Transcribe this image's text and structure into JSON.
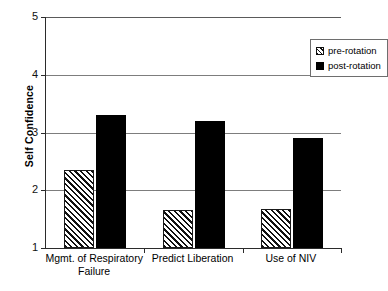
{
  "chart_data": {
    "type": "bar",
    "title": "",
    "xlabel": "",
    "ylabel": "Self Confidence",
    "ylim": [
      1,
      5
    ],
    "yticks": [
      1,
      2,
      3,
      4,
      5
    ],
    "ytick_labels": [
      "1",
      "2",
      "3",
      "4",
      "5"
    ],
    "grid": "horizontal",
    "legend_position": "top-right-inside",
    "categories": [
      "Mgmt. of Respiratory Failure",
      "Predict Liberation",
      "Use of NIV"
    ],
    "category_lines": [
      [
        "Mgmt. of Respiratory",
        "Failure"
      ],
      [
        "Predict Liberation"
      ],
      [
        "Use of NIV"
      ]
    ],
    "series": [
      {
        "name": "pre-rotation",
        "fill": "hatched",
        "color": "#000000",
        "values": [
          2.35,
          1.65,
          1.68
        ]
      },
      {
        "name": "post-rotation",
        "fill": "solid",
        "color": "#000000",
        "values": [
          3.3,
          3.2,
          2.9
        ]
      }
    ]
  },
  "legend": {
    "items": [
      {
        "label": "pre-rotation"
      },
      {
        "label": "post-rotation"
      }
    ]
  },
  "axis": {
    "y_title": "Self Confidence",
    "y_tick_1": "1",
    "y_tick_2": "2",
    "y_tick_3": "3",
    "y_tick_4": "4",
    "y_tick_5": "5"
  },
  "colors": {
    "bar_solid": "#000000",
    "bar_hatch_line": "#111111",
    "gridline": "#7d7d7d",
    "axis": "#2b2b2b",
    "background": "#ffffff"
  }
}
